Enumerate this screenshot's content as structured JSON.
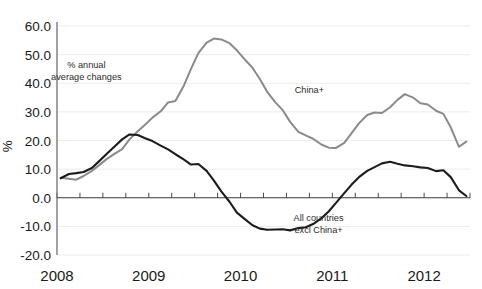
{
  "chart_data": {
    "type": "line",
    "title": "",
    "xlabel": "",
    "ylabel": "%",
    "ylim": [
      -20.0,
      60.0
    ],
    "xlim": [
      2008.0,
      2012.5
    ],
    "grid": true,
    "legend_position": "inline-annotations",
    "y_ticks": [
      "60.0",
      "50.0",
      "40.0",
      "30.0",
      "20.0",
      "10.0",
      "0.0",
      "-10.0",
      "-20.0"
    ],
    "y_tick_values": [
      60,
      50,
      40,
      30,
      20,
      10,
      0,
      -10,
      -20
    ],
    "x_ticks": [
      "2008",
      "2009",
      "2010",
      "2011",
      "2012"
    ],
    "x_tick_values": [
      2008,
      2009,
      2010,
      2011,
      2012
    ],
    "annotations": [
      {
        "name": "units-note",
        "line1": "% annual",
        "line2": "average changes",
        "x": 2008.32,
        "y": 45.5
      },
      {
        "name": "china-plus-label",
        "text": "China+",
        "x": 2010.75,
        "y": 36.5
      },
      {
        "name": "all-countries-label",
        "line1": "All countries",
        "line2": "excl China+",
        "x": 2010.85,
        "y": -8.0
      }
    ],
    "series": [
      {
        "name": "China+",
        "color": "#8a8a8a",
        "x": [
          2008.04,
          2008.13,
          2008.21,
          2008.29,
          2008.38,
          2008.46,
          2008.54,
          2008.63,
          2008.71,
          2008.79,
          2008.88,
          2008.96,
          2009.04,
          2009.13,
          2009.21,
          2009.29,
          2009.38,
          2009.46,
          2009.54,
          2009.63,
          2009.71,
          2009.79,
          2009.88,
          2009.96,
          2010.04,
          2010.13,
          2010.21,
          2010.29,
          2010.38,
          2010.46,
          2010.54,
          2010.63,
          2010.71,
          2010.79,
          2010.88,
          2010.96,
          2011.04,
          2011.13,
          2011.21,
          2011.29,
          2011.38,
          2011.46,
          2011.54,
          2011.63,
          2011.71,
          2011.79,
          2011.88,
          2011.96,
          2012.04,
          2012.13,
          2012.21,
          2012.29,
          2012.38,
          2012.46
        ],
        "values": [
          7.0,
          6.6,
          6.3,
          7.6,
          9.4,
          11.4,
          13.5,
          15.4,
          17.0,
          20.4,
          23.2,
          25.5,
          28.0,
          30.2,
          33.3,
          33.8,
          39.0,
          45.0,
          50.5,
          54.2,
          55.6,
          55.3,
          54.0,
          51.5,
          48.5,
          45.4,
          41.5,
          37.0,
          33.3,
          30.6,
          26.5,
          23.0,
          21.8,
          20.6,
          18.6,
          17.5,
          17.4,
          19.2,
          22.6,
          26.0,
          28.9,
          29.8,
          29.6,
          31.6,
          34.2,
          36.2,
          35.0,
          33.0,
          32.6,
          30.4,
          29.3,
          24.6,
          17.8,
          19.6
        ]
      },
      {
        "name": "All countries excl China+",
        "color": "#1c1c1c",
        "x": [
          2008.04,
          2008.13,
          2008.21,
          2008.29,
          2008.38,
          2008.46,
          2008.54,
          2008.63,
          2008.71,
          2008.79,
          2008.88,
          2008.96,
          2009.04,
          2009.13,
          2009.21,
          2009.29,
          2009.38,
          2009.46,
          2009.54,
          2009.63,
          2009.71,
          2009.79,
          2009.88,
          2009.96,
          2010.04,
          2010.13,
          2010.21,
          2010.29,
          2010.38,
          2010.46,
          2010.54,
          2010.63,
          2010.71,
          2010.79,
          2010.88,
          2010.96,
          2011.04,
          2011.13,
          2011.21,
          2011.29,
          2011.38,
          2011.46,
          2011.54,
          2011.63,
          2011.71,
          2011.79,
          2011.88,
          2011.96,
          2012.04,
          2012.13,
          2012.21,
          2012.29,
          2012.38,
          2012.46
        ],
        "values": [
          6.8,
          8.3,
          8.6,
          9.0,
          10.4,
          12.8,
          15.3,
          18.0,
          20.4,
          22.1,
          21.9,
          20.8,
          19.8,
          18.2,
          16.9,
          15.2,
          13.4,
          11.6,
          11.8,
          9.4,
          6.0,
          2.2,
          -1.4,
          -5.2,
          -7.3,
          -9.6,
          -10.8,
          -11.2,
          -11.1,
          -11.0,
          -11.4,
          -10.6,
          -10.3,
          -9.2,
          -7.2,
          -4.8,
          -1.8,
          1.6,
          4.6,
          7.2,
          9.4,
          10.7,
          12.0,
          12.6,
          11.9,
          11.3,
          11.0,
          10.6,
          10.4,
          9.3,
          9.6,
          7.2,
          2.6,
          0.6
        ]
      }
    ]
  },
  "plot": {
    "left": 57,
    "right": 470,
    "top": 26,
    "bottom": 255
  }
}
